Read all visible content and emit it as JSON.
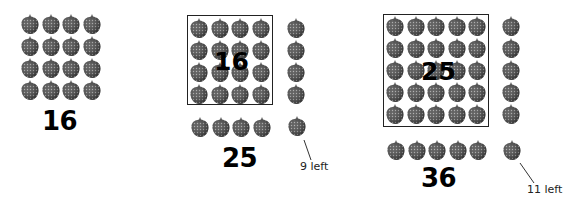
{
  "diagram": {
    "title": "",
    "groups": [
      {
        "id": "group-16",
        "label": "16",
        "square_grid": {
          "rows": 4,
          "cols": 4
        },
        "boxed": false,
        "box_label": "",
        "extra_column": 0,
        "extra_row": 0,
        "leftover_note": ""
      },
      {
        "id": "group-25",
        "label": "25",
        "square_grid": {
          "rows": 4,
          "cols": 4
        },
        "boxed": true,
        "box_label": "16",
        "extra_column": 4,
        "extra_row": 4,
        "corner": 1,
        "leftover_note": "9 left"
      },
      {
        "id": "group-36",
        "label": "36",
        "square_grid": {
          "rows": 5,
          "cols": 5
        },
        "boxed": true,
        "box_label": "25",
        "extra_column": 5,
        "extra_row": 5,
        "corner": 1,
        "leftover_note": "11 left"
      }
    ],
    "icon": "strawberry-icon",
    "colors": {
      "berry_dark": "#3a3a3a",
      "berry_mid": "#6a6a6a",
      "seed": "#b8b8b8",
      "box_border": "#222222",
      "text": "#000000"
    }
  }
}
